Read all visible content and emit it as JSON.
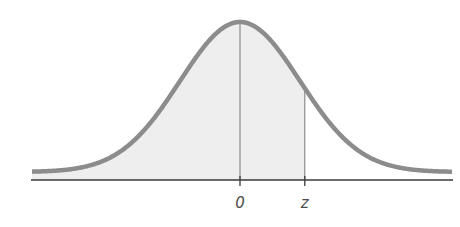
{
  "chart_data": {
    "type": "area",
    "title": "",
    "subtitle": "",
    "xlabel": "",
    "ylabel": "",
    "distribution": {
      "name": "standard normal",
      "mean": 0,
      "sd": 1
    },
    "x_range": [
      -3.5,
      3.5
    ],
    "tick_labels": [
      {
        "label": "0",
        "x": 0
      },
      {
        "label": "z",
        "x": 1.08
      }
    ],
    "shaded_region": {
      "from": "-inf",
      "to": "z"
    },
    "vertical_lines": [
      {
        "label": "0",
        "x": 0
      },
      {
        "label": "z",
        "x": 1.08
      }
    ],
    "grid": false,
    "legend": null,
    "colors": {
      "curve": "#8c8c8c",
      "fill": "#eeeeee",
      "axis": "#3a3a3a",
      "guide_lines": "#7a7a7a"
    }
  },
  "labels": {
    "mean": "0",
    "z": "z"
  }
}
